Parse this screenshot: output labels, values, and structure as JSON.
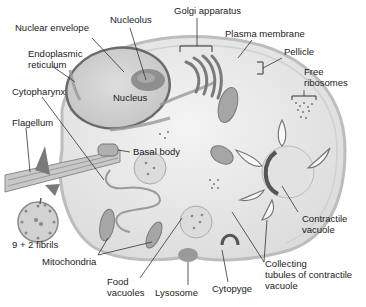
{
  "diagram": {
    "colors": {
      "cytoplasm": "#ececec",
      "membrane": "#bdbdbd",
      "nucleus": "#cfcfcf",
      "nucleus_border": "#6a6a6a",
      "nucleolus": "#8f8f8f",
      "organelle": "#a0a0a0",
      "leader_line": "#333333",
      "text": "#222222"
    },
    "labels": {
      "nuclear_envelope": "Nuclear envelope",
      "nucleolus": "Nucleolus",
      "golgi_apparatus": "Golgi apparatus",
      "plasma_membrane": "Plasma membrane",
      "pellicle": "Pellicle",
      "free_ribosomes": "Free\nribosomes",
      "endoplasmic_reticulum": "Endoplasmic\nreticulum",
      "nucleus": "Nucleus",
      "cytopharynx": "Cytopharynx",
      "flagellum": "Flagellum",
      "basal_body": "Basal body",
      "fibrils": "9 + 2 fibrils",
      "mitochondria": "Mitochondria",
      "food_vacuoles": "Food\nvacuoles",
      "lysosome": "Lysosome",
      "cytopyge": "Cytopyge",
      "collecting_tubules": "Collecting\ntubules of contractile\nvacuole",
      "contractile_vacuole": "Contractile\nvacuole"
    }
  }
}
